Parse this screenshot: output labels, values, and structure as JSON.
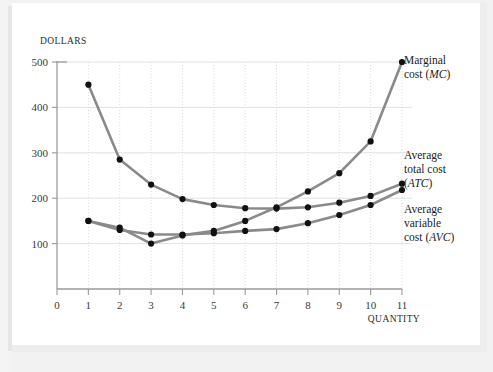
{
  "figure": {
    "y_axis_title": "DOLLARS",
    "x_axis_title": "QUANTITY"
  },
  "labels": {
    "mc": {
      "line1": "Marginal",
      "line2": "cost (",
      "abbr": "MC",
      "close": ")"
    },
    "atc": {
      "line1": "Average",
      "line2": "total cost",
      "line3_open": "(",
      "abbr": "ATC",
      "close": ")"
    },
    "avc": {
      "line1": "Average",
      "line2": "variable",
      "line3": "cost (",
      "abbr": "AVC",
      "close": ")"
    }
  },
  "colors": {
    "curve": "#8a8a8a",
    "marker": "#111111",
    "axis": "#9a9a9a",
    "grid_horizontal": "#e2e2e2",
    "grid_vertical": "#dcdcdc",
    "page": "#ffffff",
    "backdrop": "#f2f2f2"
  },
  "chart_data": {
    "type": "line",
    "title": "",
    "xlabel": "QUANTITY",
    "ylabel": "DOLLARS",
    "xlim": [
      0,
      11
    ],
    "ylim": [
      0,
      500
    ],
    "xticks": [
      0,
      1,
      2,
      3,
      4,
      5,
      6,
      7,
      8,
      9,
      10,
      11
    ],
    "yticks": [
      100,
      200,
      300,
      400,
      500
    ],
    "grid": true,
    "legend": "right-outside",
    "x": [
      1,
      2,
      3,
      4,
      5,
      6,
      7,
      8,
      9,
      10,
      11
    ],
    "series": [
      {
        "name": "Average total cost (ATC)",
        "abbr": "ATC",
        "values": [
          450,
          285,
          230,
          198,
          185,
          178,
          177,
          180,
          190,
          205,
          232
        ]
      },
      {
        "name": "Average variable cost (AVC)",
        "abbr": "AVC",
        "values": [
          150,
          130,
          120,
          120,
          123,
          128,
          132,
          145,
          163,
          185,
          218
        ]
      },
      {
        "name": "Marginal cost (MC)",
        "abbr": "MC",
        "values": [
          150,
          135,
          100,
          118,
          128,
          150,
          180,
          215,
          255,
          325,
          500
        ]
      }
    ]
  }
}
